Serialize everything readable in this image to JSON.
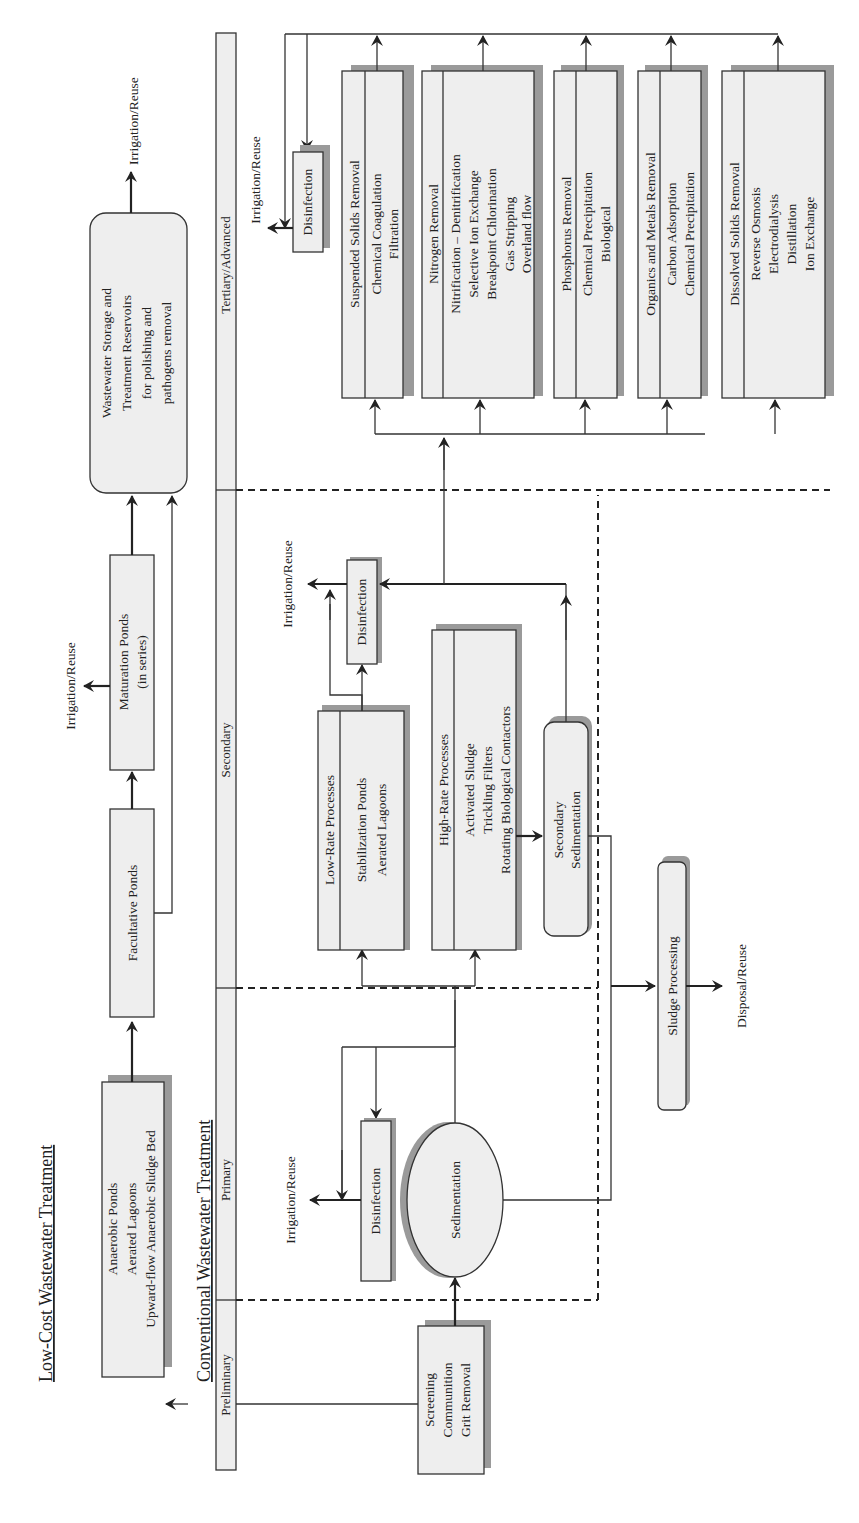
{
  "titles": {
    "low_cost": "Low-Cost Wastewater Treatment",
    "conventional": "Conventional Wastewater Treatment"
  },
  "stages": {
    "preliminary": "Preliminary",
    "primary": "Primary",
    "secondary": "Secondary",
    "tertiary": "Tertiary/Advanced"
  },
  "low_cost": {
    "anaerobic_box": [
      "Anaerobic Ponds",
      "Aerated Lagoons",
      "Upward-flow Anaerobic Sludge Bed"
    ],
    "facultative_box": [
      "Facultative Ponds"
    ],
    "maturation_box": [
      "Maturation Ponds",
      "(in series)"
    ],
    "storage_box": [
      "Wastewater Storage and",
      "Treatment Reservoirs",
      "for polishing and",
      "pathogens removal"
    ],
    "outputs": {
      "maturation": "Irrigation/Reuse",
      "storage": "Irrigation/Reuse"
    }
  },
  "conventional": {
    "preliminary_box": [
      "Screening",
      "Communition",
      "Grit Removal"
    ],
    "primary": {
      "sedimentation": "Sedimentation",
      "disinfection": "Disinfection",
      "output": "Irrigation/Reuse"
    },
    "secondary": {
      "low_rate": {
        "header": "Low-Rate Processes",
        "items": [
          "Stabilization Ponds",
          "Aerated Lagoons"
        ]
      },
      "high_rate": {
        "header": "High-Rate Processes",
        "items": [
          "Activated Sludge",
          "Trickling Filters",
          "Rotating Biological Contactors"
        ]
      },
      "secondary_sedimentation": [
        "Secondary",
        "Sedimentation"
      ],
      "disinfection": "Disinfection",
      "output": "Irrigation/Reuse",
      "sludge": "Sludge Processing",
      "sludge_output": "Disposal/Reuse"
    },
    "tertiary": {
      "disinfection": "Disinfection",
      "output": "Irrigation/Reuse",
      "boxes": [
        {
          "header": "Suspended Solids Removal",
          "items": [
            "Chemical Coagulation",
            "Filtration"
          ]
        },
        {
          "header": "Nitrogen Removal",
          "items": [
            "Nitrification – Denitrification",
            "Selective Ion Exchange",
            "Breakpoint Chlorination",
            "Gas Stripping",
            "Overland flow"
          ]
        },
        {
          "header": "Phosphorus Removal",
          "items": [
            "Chemical Precipitation",
            "Biological"
          ]
        },
        {
          "header": "Organics and Metals Removal",
          "items": [
            "Carbon Adsorption",
            "Chemical Precipitation"
          ]
        },
        {
          "header": "Dissolved Solids Removal",
          "items": [
            "Reverse Osmosis",
            "Electrodialysis",
            "Distillation",
            "Ion Exchange"
          ]
        }
      ]
    }
  }
}
